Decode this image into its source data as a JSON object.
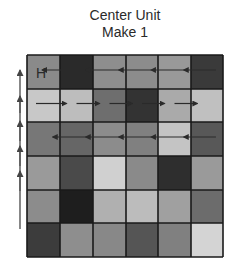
{
  "title": {
    "line1": "Center Unit",
    "line2": "Make 1"
  },
  "grid": {
    "rows": 6,
    "cols": 6,
    "origin": [
      27,
      55
    ],
    "col_edges": [
      27,
      60,
      93,
      126,
      158,
      191,
      223
    ],
    "row_edges": [
      55,
      89,
      122,
      156,
      190,
      223,
      257
    ],
    "border_color": "#1a1a1a",
    "cells": [
      [
        "#8a8a8a",
        "#2a2a2a",
        "#8e8e8e",
        "#8c8c8c",
        "#999999",
        "#3a3a3a"
      ],
      [
        "#c8c8c8",
        "#bdbdbd",
        "#6e6e6e",
        "#333333",
        "#aaaaaa",
        "#c0c0c0"
      ],
      [
        "#777777",
        "#666666",
        "#8c8c8c",
        "#808080",
        "#c4c4c4",
        "#585858"
      ],
      [
        "#9a9a9a",
        "#4a4a4a",
        "#d0d0d0",
        "#8a8a8a",
        "#2e2e2e",
        "#9a9a9a"
      ],
      [
        "#8c8c8c",
        "#1e1e1e",
        "#b0b0b0",
        "#bcbcbc",
        "#a0a0a0",
        "#6c6c6c"
      ],
      [
        "#3c3c3c",
        "#8e8e8e",
        "#888888",
        "#555555",
        "#808080",
        "#d4d4d4"
      ]
    ]
  },
  "start_label": {
    "text": "H",
    "row": 0,
    "col": 0
  },
  "row_arrows": [
    {
      "row": 0,
      "direction": "left",
      "segments": 5
    },
    {
      "row": 1,
      "direction": "right",
      "segments": 5
    },
    {
      "row": 2,
      "direction": "left",
      "segments": 5
    }
  ],
  "side_arrows": {
    "direction": "up",
    "count": 5,
    "x": 20
  },
  "colors": {
    "arrow": "#2a2a2a",
    "side_arrow": "#555555",
    "text": "#2a2a2a"
  }
}
